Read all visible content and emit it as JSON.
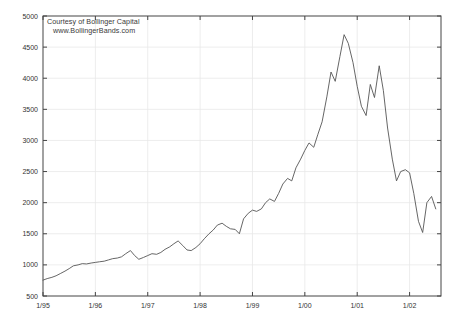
{
  "chart_data": {
    "type": "line",
    "title": "",
    "subtitle": "",
    "xlabel": "",
    "ylabel": "",
    "xlim": [
      1995.0,
      2002.6
    ],
    "ylim": [
      500,
      5000
    ],
    "grid": true,
    "legend": null,
    "legend_position": "none",
    "line_color": "#555555",
    "annotations": [
      "Courtesy of Bollinger Capital",
      "www.BollingerBands.com"
    ],
    "xtick_labels": [
      "1/95",
      "1/96",
      "1/97",
      "1/98",
      "1/99",
      "1/00",
      "1/01",
      "1/02"
    ],
    "xtick_values": [
      1995,
      1996,
      1997,
      1998,
      1999,
      2000,
      2001,
      2002
    ],
    "ytick_labels": [
      "500",
      "1000",
      "1500",
      "2000",
      "2500",
      "3000",
      "3500",
      "4000",
      "4500",
      "5000"
    ],
    "ytick_values": [
      500,
      1000,
      1500,
      2000,
      2500,
      3000,
      3500,
      4000,
      4500,
      5000
    ],
    "series": [
      {
        "name": "Index",
        "x": [
          1995.0,
          1995.08,
          1995.17,
          1995.25,
          1995.33,
          1995.42,
          1995.5,
          1995.58,
          1995.67,
          1995.75,
          1995.83,
          1995.92,
          1996.0,
          1996.08,
          1996.17,
          1996.25,
          1996.33,
          1996.42,
          1996.5,
          1996.58,
          1996.67,
          1996.75,
          1996.83,
          1996.92,
          1997.0,
          1997.08,
          1997.17,
          1997.25,
          1997.33,
          1997.42,
          1997.5,
          1997.58,
          1997.67,
          1997.75,
          1997.83,
          1997.92,
          1998.0,
          1998.08,
          1998.17,
          1998.25,
          1998.33,
          1998.42,
          1998.5,
          1998.58,
          1998.67,
          1998.75,
          1998.83,
          1998.92,
          1999.0,
          1999.08,
          1999.17,
          1999.25,
          1999.33,
          1999.42,
          1999.5,
          1999.58,
          1999.67,
          1999.75,
          1999.83,
          1999.92,
          2000.0,
          2000.08,
          2000.17,
          2000.25,
          2000.33,
          2000.42,
          2000.5,
          2000.58,
          2000.67,
          2000.75,
          2000.83,
          2000.92,
          2001.0,
          2001.08,
          2001.17,
          2001.25,
          2001.33,
          2001.42,
          2001.5,
          2001.58,
          2001.67,
          2001.75,
          2001.83,
          2001.92,
          2002.0,
          2002.08,
          2002.17,
          2002.25,
          2002.33,
          2002.42,
          2002.5
        ],
        "values": [
          755,
          780,
          800,
          825,
          860,
          900,
          940,
          985,
          1000,
          1020,
          1015,
          1030,
          1040,
          1050,
          1060,
          1080,
          1100,
          1110,
          1130,
          1180,
          1230,
          1150,
          1090,
          1120,
          1150,
          1180,
          1170,
          1200,
          1250,
          1290,
          1340,
          1385,
          1310,
          1240,
          1230,
          1280,
          1340,
          1420,
          1500,
          1560,
          1640,
          1670,
          1620,
          1580,
          1570,
          1500,
          1740,
          1830,
          1880,
          1860,
          1900,
          2000,
          2060,
          2020,
          2150,
          2300,
          2390,
          2350,
          2560,
          2700,
          2840,
          2960,
          2890,
          3100,
          3300,
          3700,
          4100,
          3950,
          4350,
          4700,
          4560,
          4250,
          3870,
          3550,
          3400,
          3900,
          3690,
          4200,
          3800,
          3200,
          2700,
          2350,
          2500,
          2530,
          2480,
          2150,
          1700,
          1520,
          2000,
          2100,
          1900
        ]
      }
    ]
  }
}
